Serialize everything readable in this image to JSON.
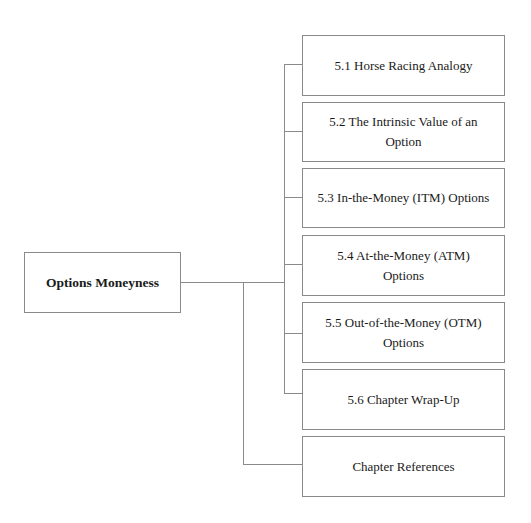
{
  "diagram": {
    "root": {
      "label": "Options Moneyness"
    },
    "children": [
      {
        "label": "5.1 Horse Racing Analogy"
      },
      {
        "label": "5.2 The Intrinsic Value of an Option"
      },
      {
        "label": "5.3 In-the-Money (ITM) Options"
      },
      {
        "label": "5.4 At-the-Money (ATM) Options"
      },
      {
        "label": "5.5 Out-of-the-Money (OTM) Options"
      },
      {
        "label": "5.6 Chapter Wrap-Up"
      },
      {
        "label": "Chapter References"
      }
    ],
    "colors": {
      "line": "#8a8a8a",
      "text": "#1a1a1a",
      "background": "#ffffff"
    }
  }
}
